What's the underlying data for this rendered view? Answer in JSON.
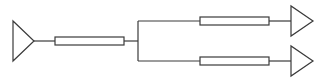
{
  "diagram": {
    "type": "branch-schematic",
    "colors": {
      "stroke": "#3a3a3a",
      "background": "#ffffff",
      "fill": "#ffffff"
    },
    "nodes": [
      {
        "id": "input-port",
        "kind": "triangle-port",
        "direction": "right"
      },
      {
        "id": "trunk-line",
        "kind": "line-element"
      },
      {
        "id": "junction",
        "kind": "split",
        "outputs": 2
      },
      {
        "id": "branch-1-line",
        "kind": "line-element"
      },
      {
        "id": "branch-1-port",
        "kind": "triangle-port",
        "direction": "right"
      },
      {
        "id": "branch-2-line",
        "kind": "line-element"
      },
      {
        "id": "branch-2-port",
        "kind": "triangle-port",
        "direction": "right"
      }
    ],
    "edges": [
      [
        "input-port",
        "trunk-line"
      ],
      [
        "trunk-line",
        "junction"
      ],
      [
        "junction",
        "branch-1-line"
      ],
      [
        "branch-1-line",
        "branch-1-port"
      ],
      [
        "junction",
        "branch-2-line"
      ],
      [
        "branch-2-line",
        "branch-2-port"
      ]
    ],
    "labels": []
  }
}
